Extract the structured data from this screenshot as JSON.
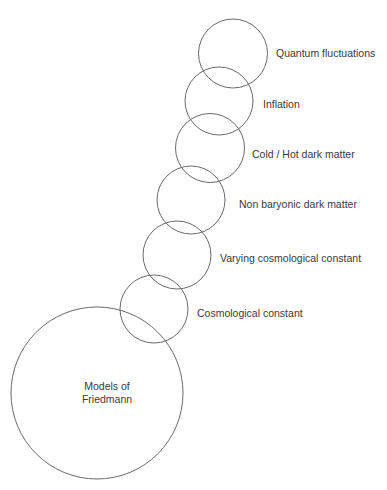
{
  "diagram": {
    "type": "chain-of-overlapping-circles",
    "stroke_color": "#6a6a6a",
    "text_color": "#3a3a3a",
    "base": {
      "id": "friedmann",
      "label_line1": "Models of",
      "label_line2": "Friedmann",
      "cx": 97,
      "cy": 393,
      "r": 86,
      "label_x": 107,
      "label_y": 393
    },
    "nodes": [
      {
        "id": "cosmological-constant",
        "label": "Cosmological constant",
        "cx": 154,
        "cy": 309,
        "r": 34,
        "label_x": 197,
        "label_y": 313
      },
      {
        "id": "varying-cosmological-constant",
        "label": "Varying cosmological constant",
        "cx": 177,
        "cy": 255,
        "r": 34,
        "label_x": 220,
        "label_y": 258
      },
      {
        "id": "non-baryonic-dark-matter",
        "label": "Non baryonic dark matter",
        "cx": 191,
        "cy": 200,
        "r": 34,
        "label_x": 239,
        "label_y": 204
      },
      {
        "id": "cold-hot-dark-matter",
        "label": "Cold / Hot dark matter",
        "cx": 210,
        "cy": 148,
        "r": 34.5,
        "label_x": 252,
        "label_y": 154
      },
      {
        "id": "inflation",
        "label": "Inflation",
        "cx": 219,
        "cy": 101,
        "r": 34,
        "label_x": 263,
        "label_y": 104
      },
      {
        "id": "quantum-fluctuations",
        "label": "Quantum fluctuations",
        "cx": 233,
        "cy": 53.5,
        "r": 34.5,
        "label_x": 276,
        "label_y": 53
      }
    ]
  }
}
